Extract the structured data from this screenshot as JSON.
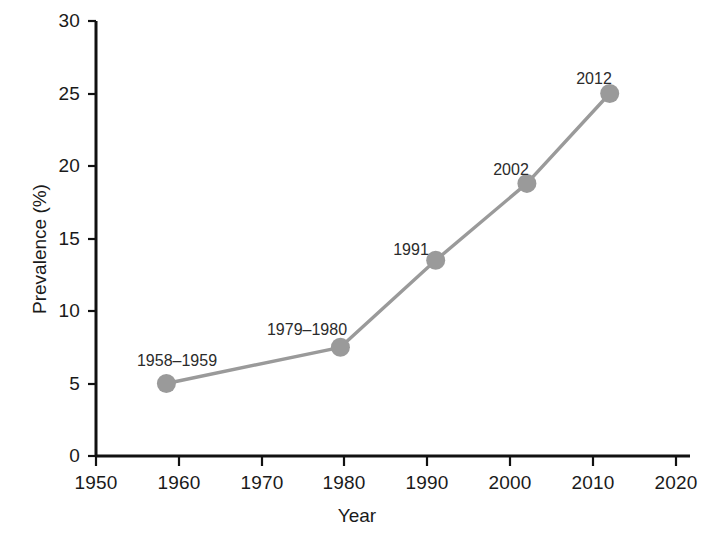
{
  "chart_data": {
    "type": "line",
    "title": "",
    "xlabel": "Year",
    "ylabel": "Prevalence (%)",
    "xlim": [
      1950,
      2020
    ],
    "ylim": [
      0,
      30
    ],
    "xticks": [
      1950,
      1960,
      1970,
      1980,
      1990,
      2000,
      2010,
      2020
    ],
    "yticks": [
      0,
      5,
      10,
      15,
      20,
      25,
      30
    ],
    "grid": false,
    "legend": false,
    "series": [
      {
        "name": "Prevalence",
        "line_color": "#9a9a9a",
        "marker_color": "#9a9a9a",
        "x": [
          1958.5,
          1979.5,
          1991,
          2002,
          2012
        ],
        "values": [
          5.0,
          7.5,
          13.5,
          18.8,
          25.0
        ],
        "point_labels": [
          "1958–1959",
          "1979–1980",
          "1991",
          "2002",
          "2012"
        ]
      }
    ],
    "annotations": [
      {
        "text": "1958–1959",
        "x": 1958.5,
        "y": 5.0
      },
      {
        "text": "1979–1980",
        "x": 1979.5,
        "y": 7.5
      },
      {
        "text": "1991",
        "x": 1991,
        "y": 13.5
      },
      {
        "text": "2002",
        "x": 2002,
        "y": 18.8
      },
      {
        "text": "2012",
        "x": 2012,
        "y": 25.0
      }
    ],
    "axis_color": "#111111",
    "background": "#ffffff"
  },
  "axes": {
    "y_tick_labels": [
      "30",
      "25",
      "20",
      "15",
      "10",
      "5",
      "0"
    ],
    "x_tick_labels": [
      "1950",
      "1960",
      "1970",
      "1980",
      "1990",
      "2000",
      "2010",
      "2020"
    ],
    "y_axis_title": "Prevalence (%)",
    "x_axis_title": "Year"
  },
  "point_labels": {
    "p0": "1958–1959",
    "p1": "1979–1980",
    "p2": "1991",
    "p3": "2002",
    "p4": "2012"
  }
}
